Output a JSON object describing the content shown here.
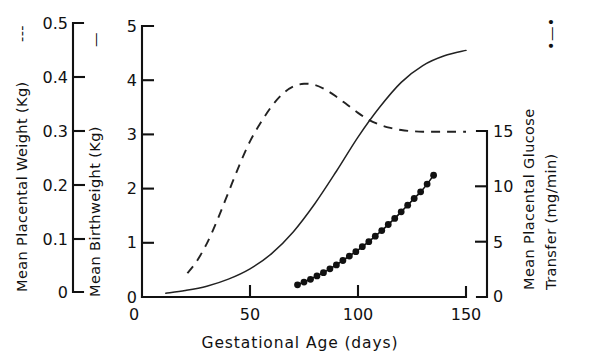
{
  "chart_data": {
    "type": "line",
    "title": "",
    "xlabel": "Gestational Age (days)",
    "xlim": [
      0,
      150
    ],
    "xticks": [
      0,
      50,
      100,
      150
    ],
    "xticklabels": [
      "0",
      "50",
      "100",
      "150"
    ],
    "grid": false,
    "legend": "inline-in-axis-titles",
    "axes": [
      {
        "id": "left",
        "label": "Mean Placental Weight (Kg)",
        "legend_marker": "dashed-line",
        "legend_marker_glyph": "---",
        "ylim": [
          0,
          0.5
        ],
        "yticks": [
          0,
          0.1,
          0.2,
          0.3,
          0.4,
          0.5
        ],
        "yticklabels": [
          "0",
          "0.1",
          "0.2",
          "0.3",
          "0.4",
          "0.5"
        ]
      },
      {
        "id": "middle",
        "label": "Mean Birthweight (Kg)",
        "legend_marker": "solid-line",
        "legend_marker_glyph": "—",
        "ylim": [
          0,
          5
        ],
        "yticks": [
          0,
          1,
          2,
          3,
          4,
          5
        ],
        "yticklabels": [
          "0",
          "1",
          "2",
          "3",
          "4",
          "5"
        ]
      },
      {
        "id": "right",
        "label": "Mean Placental Glucose Transfer (mg/min)",
        "legend_marker": "filled-circles-line",
        "legend_marker_glyph": "•—•",
        "ylim": [
          0,
          15
        ],
        "yticks": [
          0,
          5,
          10,
          15
        ],
        "yticklabels": [
          "0",
          "5",
          "10",
          "15"
        ]
      }
    ],
    "series": [
      {
        "name": "Mean Placental Weight",
        "axis": "left",
        "unit": "Kg",
        "style": "dashed",
        "x": [
          21,
          25,
          30,
          35,
          40,
          45,
          50,
          55,
          60,
          65,
          70,
          75,
          80,
          85,
          90,
          95,
          100,
          105,
          110,
          115,
          120,
          125,
          130,
          135,
          140,
          145,
          150
        ],
        "y": [
          0.035,
          0.055,
          0.09,
          0.135,
          0.185,
          0.235,
          0.28,
          0.315,
          0.345,
          0.368,
          0.382,
          0.387,
          0.385,
          0.376,
          0.363,
          0.348,
          0.333,
          0.32,
          0.311,
          0.305,
          0.301,
          0.299,
          0.298,
          0.298,
          0.298,
          0.298,
          0.298
        ]
      },
      {
        "name": "Mean Birthweight",
        "axis": "middle",
        "unit": "Kg",
        "style": "solid",
        "x": [
          11,
          20,
          30,
          40,
          50,
          60,
          70,
          80,
          90,
          100,
          110,
          120,
          130,
          140,
          150
        ],
        "y": [
          0.07,
          0.12,
          0.2,
          0.33,
          0.52,
          0.8,
          1.2,
          1.72,
          2.32,
          2.95,
          3.5,
          3.96,
          4.27,
          4.45,
          4.55
        ]
      },
      {
        "name": "Mean Placental Glucose Transfer",
        "axis": "right",
        "unit": "mg/min",
        "style": "filled-circles",
        "x": [
          72,
          75,
          78,
          81,
          84,
          87,
          90,
          93,
          96,
          99,
          102,
          105,
          108,
          111,
          114,
          117,
          120,
          123,
          126,
          129,
          132,
          135
        ],
        "y": [
          1.1,
          1.35,
          1.6,
          1.9,
          2.2,
          2.55,
          2.9,
          3.3,
          3.7,
          4.1,
          4.55,
          5.0,
          5.5,
          6.0,
          6.55,
          7.1,
          7.7,
          8.3,
          8.9,
          9.5,
          10.2,
          11.0
        ]
      }
    ]
  },
  "axis_titles": {
    "left": "Mean Placental Weight (Kg)",
    "left_marker": "---",
    "middle": "Mean Birthweight (Kg)",
    "middle_marker": "—",
    "right_line1": "Mean Placental Glucose",
    "right_line2": "Transfer (mg/min)",
    "right_marker": "•—•",
    "x": "Gestational Age (days)"
  },
  "ticks": {
    "left": [
      "0.5",
      "0.4",
      "0.3",
      "0.2",
      "0.1",
      "0"
    ],
    "middle": [
      "5",
      "4",
      "3",
      "2",
      "1",
      "0"
    ],
    "right": [
      "15",
      "10",
      "5",
      "0"
    ],
    "x": [
      "0",
      "50",
      "100",
      "150"
    ]
  }
}
